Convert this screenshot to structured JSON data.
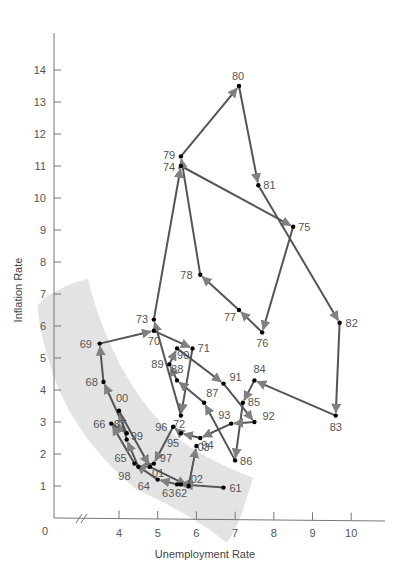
{
  "chart_data": {
    "type": "scatter",
    "subtype": "connected-scatter-with-arrows",
    "title": "",
    "xlabel": "Unemployment Rate",
    "ylabel": "Inflation Rate",
    "xlim": [
      0,
      11
    ],
    "ylim": [
      0,
      15
    ],
    "x_axis_break": true,
    "origin_label": "0",
    "x_ticks": [
      4,
      5,
      6,
      7,
      8,
      9,
      10
    ],
    "y_ticks": [
      1,
      2,
      3,
      4,
      5,
      6,
      7,
      8,
      9,
      10,
      11,
      12,
      13,
      14
    ],
    "grid": false,
    "legend": null,
    "shaded_band": {
      "description": "light gray curved band along the lower-left (1960s and late 1990s-2000s points)",
      "color": "#e3e3e3"
    },
    "colors": {
      "line": "#555555",
      "arrow": "#808080",
      "point": "#000000",
      "axis": "#777777"
    },
    "points": [
      {
        "label": "61",
        "x": 6.7,
        "y": 0.95,
        "lx": 6,
        "ly": 4
      },
      {
        "label": "62",
        "x": 5.6,
        "y": 1.05,
        "lx": -6,
        "ly": 13
      },
      {
        "label": "63",
        "x": 5.5,
        "y": 1.05,
        "lx": -15,
        "ly": 13
      },
      {
        "label": "64",
        "x": 5.0,
        "y": 1.2,
        "lx": -20,
        "ly": 10
      },
      {
        "label": "65",
        "x": 4.4,
        "y": 1.7,
        "lx": -20,
        "ly": -2
      },
      {
        "label": "66",
        "x": 3.8,
        "y": 2.95,
        "lx": -18,
        "ly": 4
      },
      {
        "label": "67",
        "x": 4.2,
        "y": 2.65,
        "lx": -13,
        "ly": -5
      },
      {
        "label": "68",
        "x": 3.6,
        "y": 4.25,
        "lx": -18,
        "ly": 4
      },
      {
        "label": "69",
        "x": 3.5,
        "y": 5.45,
        "lx": -20,
        "ly": 4
      },
      {
        "label": "70",
        "x": 4.9,
        "y": 5.85,
        "lx": -6,
        "ly": 14
      },
      {
        "label": "71",
        "x": 5.9,
        "y": 5.3,
        "lx": 5,
        "ly": 4
      },
      {
        "label": "72",
        "x": 5.6,
        "y": 3.2,
        "lx": -8,
        "ly": 12
      },
      {
        "label": "73",
        "x": 4.9,
        "y": 6.2,
        "lx": -18,
        "ly": 3
      },
      {
        "label": "74",
        "x": 5.6,
        "y": 11.0,
        "lx": -18,
        "ly": 5
      },
      {
        "label": "75",
        "x": 8.5,
        "y": 9.1,
        "lx": 5,
        "ly": 4
      },
      {
        "label": "76",
        "x": 7.7,
        "y": 5.8,
        "lx": -6,
        "ly": 15
      },
      {
        "label": "77",
        "x": 7.1,
        "y": 6.5,
        "lx": -15,
        "ly": 11
      },
      {
        "label": "78",
        "x": 6.1,
        "y": 7.6,
        "lx": -20,
        "ly": 4
      },
      {
        "label": "79",
        "x": 5.6,
        "y": 11.3,
        "lx": -18,
        "ly": 3
      },
      {
        "label": "80",
        "x": 7.1,
        "y": 13.5,
        "lx": -7,
        "ly": -6
      },
      {
        "label": "81",
        "x": 7.6,
        "y": 10.4,
        "lx": 5,
        "ly": 4
      },
      {
        "label": "82",
        "x": 9.7,
        "y": 6.1,
        "lx": 6,
        "ly": 4
      },
      {
        "label": "83",
        "x": 9.6,
        "y": 3.2,
        "lx": -6,
        "ly": 15
      },
      {
        "label": "84",
        "x": 7.5,
        "y": 4.3,
        "lx": -1,
        "ly": -7
      },
      {
        "label": "85",
        "x": 7.2,
        "y": 3.6,
        "lx": 5,
        "ly": 3
      },
      {
        "label": "86",
        "x": 7.0,
        "y": 1.8,
        "lx": 5,
        "ly": 5
      },
      {
        "label": "87",
        "x": 6.2,
        "y": 3.6,
        "lx": 2,
        "ly": -6
      },
      {
        "label": "88",
        "x": 5.5,
        "y": 4.3,
        "lx": -6,
        "ly": -7
      },
      {
        "label": "89",
        "x": 5.3,
        "y": 4.8,
        "lx": -18,
        "ly": 4
      },
      {
        "label": "90",
        "x": 5.5,
        "y": 5.3,
        "lx": 0,
        "ly": 11
      },
      {
        "label": "91",
        "x": 6.7,
        "y": 4.2,
        "lx": 6,
        "ly": -3
      },
      {
        "label": "92",
        "x": 7.5,
        "y": 3.0,
        "lx": 8,
        "ly": -2
      },
      {
        "label": "93",
        "x": 6.9,
        "y": 2.95,
        "lx": -13,
        "ly": -5
      },
      {
        "label": "94",
        "x": 6.1,
        "y": 2.5,
        "lx": 1,
        "ly": 11
      },
      {
        "label": "95",
        "x": 5.6,
        "y": 2.65,
        "lx": -14,
        "ly": 14
      },
      {
        "label": "96",
        "x": 5.4,
        "y": 2.85,
        "lx": -18,
        "ly": 4
      },
      {
        "label": "97",
        "x": 4.9,
        "y": 1.7,
        "lx": 6,
        "ly": -2
      },
      {
        "label": "98",
        "x": 4.5,
        "y": 1.6,
        "lx": -20,
        "ly": 13
      },
      {
        "label": "99",
        "x": 4.2,
        "y": 2.45,
        "lx": 4,
        "ly": 0
      },
      {
        "label": "00",
        "x": 4.0,
        "y": 3.35,
        "lx": -3,
        "ly": -9
      },
      {
        "label": "01",
        "x": 4.8,
        "y": 1.6,
        "lx": 2,
        "ly": 10
      },
      {
        "label": "02",
        "x": 5.8,
        "y": 1.0,
        "lx": 2,
        "ly": -3
      },
      {
        "label": "03",
        "x": 6.0,
        "y": 2.25,
        "lx": 1,
        "ly": 5
      }
    ],
    "arrows": [
      [
        "61",
        "62"
      ],
      [
        "62",
        "63"
      ],
      [
        "63",
        "64"
      ],
      [
        "64",
        "65"
      ],
      [
        "65",
        "66"
      ],
      [
        "66",
        "67"
      ],
      [
        "67",
        "68"
      ],
      [
        "68",
        "69"
      ],
      [
        "69",
        "70"
      ],
      [
        "70",
        "71"
      ],
      [
        "71",
        "72"
      ],
      [
        "72",
        "73"
      ],
      [
        "73",
        "74"
      ],
      [
        "74",
        "75"
      ],
      [
        "75",
        "76"
      ],
      [
        "76",
        "77"
      ],
      [
        "77",
        "78"
      ],
      [
        "78",
        "79"
      ],
      [
        "79",
        "80"
      ],
      [
        "80",
        "81"
      ],
      [
        "81",
        "82"
      ],
      [
        "82",
        "83"
      ],
      [
        "83",
        "84"
      ],
      [
        "84",
        "85"
      ],
      [
        "85",
        "86"
      ],
      [
        "86",
        "87"
      ],
      [
        "87",
        "88"
      ],
      [
        "88",
        "89"
      ],
      [
        "89",
        "90"
      ],
      [
        "90",
        "91"
      ],
      [
        "91",
        "92"
      ],
      [
        "92",
        "93"
      ],
      [
        "93",
        "94"
      ],
      [
        "94",
        "95"
      ],
      [
        "95",
        "96"
      ],
      [
        "96",
        "97"
      ],
      [
        "97",
        "98"
      ],
      [
        "98",
        "99"
      ],
      [
        "99",
        "00"
      ],
      [
        "00",
        "01"
      ],
      [
        "01",
        "02"
      ],
      [
        "02",
        "03"
      ]
    ]
  }
}
